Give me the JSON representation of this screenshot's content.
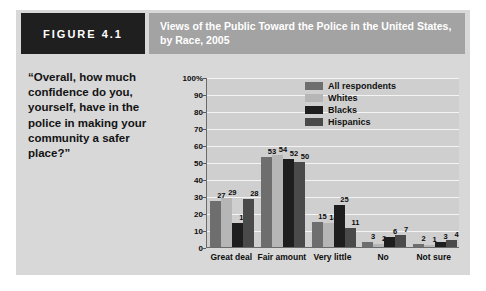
{
  "figure": {
    "tag": "FIGURE 4.1",
    "title": "Views of the Public Toward the Police in the United States, by Race, 2005",
    "quote": "“Overall, how much confidence do you, yourself, have in the police in making your community a safer place?”"
  },
  "colors": {
    "panel_background": "#d8d8d8",
    "tag_background": "#201f1f",
    "title_band": "#a3a3a3",
    "plot_background": "#cfcfcf",
    "gridline": "#f4f4f4",
    "axis": "#6a6a6a",
    "series_all_respondents": "#6e6e6e",
    "series_whites": "#b6b6b6",
    "series_blacks": "#1e1e1e",
    "series_hispanics": "#4a4a4a"
  },
  "chart_data": {
    "type": "bar",
    "title": "Views of the Public Toward the Police in the United States, by Race, 2005",
    "xlabel": "",
    "ylabel": "",
    "ylim": [
      0,
      100
    ],
    "yticks": [
      "0",
      "10",
      "20",
      "30",
      "40",
      "50",
      "60",
      "70",
      "80",
      "90",
      "100%"
    ],
    "ytick_values": [
      0,
      10,
      20,
      30,
      40,
      50,
      60,
      70,
      80,
      90,
      100
    ],
    "grid": true,
    "legend_position": "upper right",
    "categories": [
      "Great deal",
      "Fair amount",
      "Very little",
      "No",
      "Not sure"
    ],
    "series": [
      {
        "name": "All respondents",
        "color": "#6e6e6e",
        "values": [
          27,
          53,
          15,
          3,
          2
        ]
      },
      {
        "name": "Whites",
        "color": "#b6b6b6",
        "values": [
          29,
          54,
          14,
          2,
          1
        ]
      },
      {
        "name": "Blacks",
        "color": "#1e1e1e",
        "values": [
          14,
          52,
          25,
          6,
          3
        ]
      },
      {
        "name": "Hispanics",
        "color": "#4a4a4a",
        "values": [
          28,
          50,
          11,
          7,
          4
        ]
      }
    ]
  }
}
